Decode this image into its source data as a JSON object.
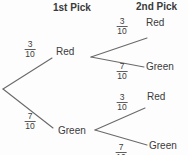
{
  "headers": {
    "first_pick": "1st Pick",
    "second_pick": "2nd Pick"
  },
  "tree": {
    "level1": [
      {
        "label": "Red",
        "fraction": {
          "num": "3",
          "den": "10"
        }
      },
      {
        "label": "Green",
        "fraction": {
          "num": "7",
          "den": "10"
        }
      }
    ],
    "level2": [
      {
        "from": "Red",
        "label": "Red",
        "fraction": {
          "num": "3",
          "den": "10"
        }
      },
      {
        "from": "Red",
        "label": "Green",
        "fraction": {
          "num": "7",
          "den": "10"
        }
      },
      {
        "from": "Green",
        "label": "Red",
        "fraction": {
          "num": "3",
          "den": "10"
        }
      },
      {
        "from": "Green",
        "label": "Green",
        "fraction": {
          "num": "7",
          "den": "10"
        }
      }
    ]
  },
  "colors": {
    "text": "#3b3b3b",
    "line": "#6a6a6a",
    "background": "#fdfdfd"
  }
}
